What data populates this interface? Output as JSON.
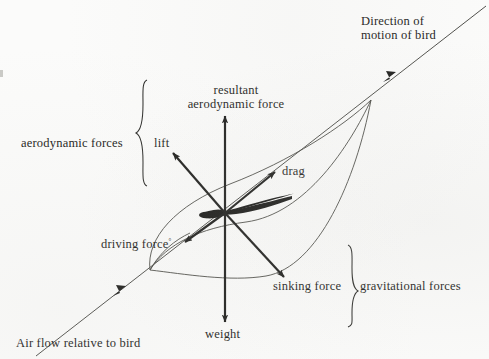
{
  "figure": {
    "background_color": "#fbfbfa",
    "ink_color": "#1a1a18"
  },
  "labels": {
    "direction_of_motion_line1": "Direction of",
    "direction_of_motion_line2": "motion of bird",
    "resultant_line1": "resultant",
    "resultant_line2": "aerodynamic force",
    "aerodynamic_forces": "aerodynamic forces",
    "gravitational_forces": "gravitational forces",
    "lift": "lift",
    "drag": "drag",
    "driving_force": "driving force",
    "driving_force_mark": "°",
    "sinking_force": "sinking force",
    "weight": "weight",
    "air_flow": "Air flow relative to bird"
  },
  "vectors": [
    {
      "name": "resultant-aerodynamic-force",
      "label": "resultant aerodynamic force",
      "direction": "up",
      "origin": [
        225,
        213
      ],
      "tip": [
        225,
        113
      ]
    },
    {
      "name": "lift",
      "label": "lift",
      "direction": "up-left",
      "origin": [
        225,
        213
      ],
      "tip": [
        171,
        151
      ]
    },
    {
      "name": "drag",
      "label": "drag",
      "direction": "up-right",
      "origin": [
        225,
        213
      ],
      "tip": [
        277,
        170
      ]
    },
    {
      "name": "driving-force",
      "label": "driving force",
      "direction": "down-left",
      "origin": [
        225,
        213
      ],
      "tip": [
        182,
        244
      ]
    },
    {
      "name": "sinking-force",
      "label": "sinking force",
      "direction": "down-right",
      "origin": [
        225,
        213
      ],
      "tip": [
        286,
        279
      ]
    },
    {
      "name": "weight",
      "label": "weight",
      "direction": "down",
      "origin": [
        225,
        213
      ],
      "tip": [
        225,
        325
      ]
    },
    {
      "name": "air-flow-relative-to-bird",
      "label": "Air flow relative to bird",
      "direction": "up-right",
      "origin": [
        63,
        334
      ],
      "tip": [
        120,
        291
      ]
    },
    {
      "name": "direction-of-motion-of-bird",
      "label": "Direction of motion of bird",
      "direction": "down-left",
      "origin": [
        470,
        12
      ],
      "tip": [
        385,
        80
      ]
    }
  ],
  "brackets": [
    {
      "name": "aerodynamic-forces-brace",
      "label": "aerodynamic forces",
      "orientation": "left",
      "span_y": [
        80,
        186
      ]
    },
    {
      "name": "gravitational-forces-brace",
      "label": "gravitational forces",
      "orientation": "right",
      "span_y": [
        245,
        327
      ]
    }
  ]
}
